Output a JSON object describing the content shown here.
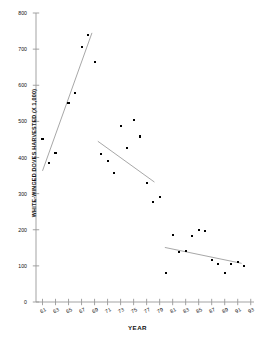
{
  "chart_data": {
    "type": "scatter",
    "title": "",
    "xlabel": "YEAR",
    "ylabel": "WHITE-WINGED DOVES HARVESTED (X 1,000)",
    "xlim": [
      60,
      93.5
    ],
    "ylim": [
      0,
      800
    ],
    "grid": false,
    "legend": "none",
    "xticks": [
      "61",
      "63",
      "65",
      "67",
      "69",
      "71",
      "73",
      "75",
      "77",
      "79",
      "81",
      "83",
      "85",
      "87",
      "89",
      "91",
      "93"
    ],
    "xtick_values": [
      61,
      63,
      65,
      67,
      69,
      71,
      73,
      75,
      77,
      79,
      81,
      83,
      85,
      87,
      89,
      91,
      93
    ],
    "yticks": [
      "0",
      "100",
      "200",
      "300",
      "400",
      "500",
      "600",
      "700",
      "800"
    ],
    "ytick_values": [
      0,
      100,
      200,
      300,
      400,
      500,
      600,
      700,
      800
    ],
    "series": [
      {
        "name": "White-winged doves harvested",
        "x": [
          61,
          62,
          63,
          65,
          66,
          67,
          68,
          69,
          70,
          71,
          72,
          73,
          74,
          75,
          76,
          77,
          78,
          79,
          80,
          81,
          82,
          83,
          84,
          85,
          86,
          87,
          88,
          89,
          90,
          91,
          92
        ],
        "y": [
          450,
          385,
          413,
          550,
          578,
          705,
          740,
          665,
          409,
          391,
          357,
          487,
          427,
          505,
          458,
          330,
          278,
          291,
          80,
          186,
          138,
          141,
          182,
          199,
          197,
          117,
          104,
          80,
          106,
          111,
          100
        ]
      }
    ],
    "trendlines": [
      {
        "name": "trend-1961-1968",
        "x0": 61.0,
        "y0": 363,
        "x1": 68.6,
        "y1": 745
      },
      {
        "name": "trend-1970-1978",
        "x0": 69.5,
        "y0": 445,
        "x1": 78.2,
        "y1": 332
      },
      {
        "name": "trend-1980-1992",
        "x0": 79.8,
        "y0": 151,
        "x1": 91.6,
        "y1": 107
      }
    ]
  },
  "axis": {
    "x_title": "YEAR",
    "y_title": "WHITE-WINGED DOVES HARVESTED (X 1,000)"
  }
}
